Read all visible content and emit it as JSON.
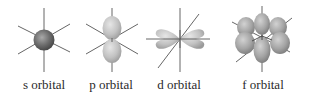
{
  "diagram": {
    "title": "",
    "orbitals": [
      {
        "id": "s",
        "label": "s orbital",
        "center_x": 44,
        "label_x": 44
      },
      {
        "id": "p",
        "label": "p orbital",
        "center_x": 112,
        "label_x": 111
      },
      {
        "id": "d",
        "label": "d orbital",
        "center_x": 180,
        "label_x": 179
      },
      {
        "id": "f",
        "label": "f orbital",
        "center_x": 262,
        "label_x": 263
      }
    ],
    "colors": {
      "axis": "#555555",
      "s_lobe": "#6e6e6e",
      "lobe_light": "#c8c8c8",
      "lobe_mid": "#a8a8a8",
      "label": "#2a2a2a"
    }
  }
}
